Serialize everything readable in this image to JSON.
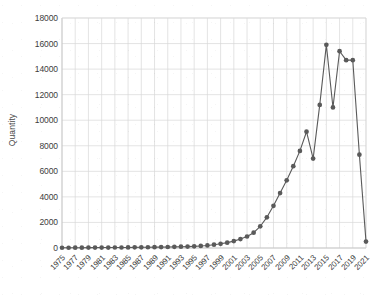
{
  "chart_data": {
    "type": "line",
    "title": "",
    "subtitle": "",
    "xlabel": "",
    "ylabel": "Quantity",
    "xlim": [
      1975,
      2021
    ],
    "ylim": [
      0,
      18000
    ],
    "ytick_step": 2000,
    "xtick_step": 2,
    "grid": true,
    "legend": null,
    "marker": "circle",
    "series_color": "#5a5a5a",
    "grid_color": "#d9d9d9",
    "x": [
      1975,
      1976,
      1977,
      1978,
      1979,
      1980,
      1981,
      1982,
      1983,
      1984,
      1985,
      1986,
      1987,
      1988,
      1989,
      1990,
      1991,
      1992,
      1993,
      1994,
      1995,
      1996,
      1997,
      1998,
      1999,
      2000,
      2001,
      2002,
      2003,
      2004,
      2005,
      2006,
      2007,
      2008,
      2009,
      2010,
      2011,
      2012,
      2013,
      2014,
      2015,
      2016,
      2017,
      2018,
      2019,
      2020,
      2021
    ],
    "values": [
      20,
      20,
      25,
      25,
      30,
      30,
      35,
      35,
      40,
      40,
      45,
      50,
      55,
      60,
      65,
      70,
      80,
      90,
      100,
      110,
      130,
      160,
      200,
      260,
      330,
      420,
      540,
      700,
      900,
      1200,
      1700,
      2400,
      3300,
      4300,
      5300,
      6400,
      7600,
      9100,
      7000,
      11200,
      15900,
      11000,
      15400,
      14700,
      14700,
      7300,
      500
    ],
    "ytick_labels": [
      "0",
      "2000",
      "4000",
      "6000",
      "8000",
      "10000",
      "12000",
      "14000",
      "16000",
      "18000"
    ],
    "ytick_values": [
      0,
      2000,
      4000,
      6000,
      8000,
      10000,
      12000,
      14000,
      16000,
      18000
    ],
    "xtick_labels": [
      "1975",
      "1977",
      "1979",
      "1981",
      "1983",
      "1985",
      "1987",
      "1989",
      "1991",
      "1993",
      "1995",
      "1997",
      "1999",
      "2001",
      "2003",
      "2005",
      "2007",
      "2009",
      "2011",
      "2013",
      "2015",
      "2017",
      "2019",
      "2021"
    ],
    "xtick_values": [
      1975,
      1977,
      1979,
      1981,
      1983,
      1985,
      1987,
      1989,
      1991,
      1993,
      1995,
      1997,
      1999,
      2001,
      2003,
      2005,
      2007,
      2009,
      2011,
      2013,
      2015,
      2017,
      2019,
      2021
    ]
  },
  "figure": {
    "caption_fragment": ""
  }
}
